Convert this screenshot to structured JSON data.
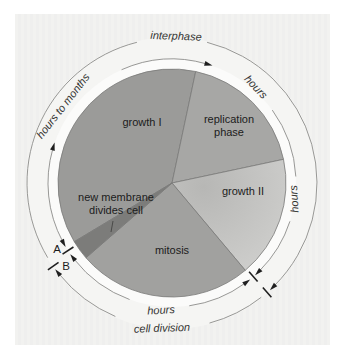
{
  "figure": {
    "colors": {
      "panel_bg": "#f1f1ef",
      "ring_band": "#fbfbfa",
      "outer_band": "#f5f5f3",
      "arc_line": "#8c8c8a",
      "slice_border": "#7a7a78",
      "tick_arrow": "#1f1f1f",
      "text": "#1c1c1c"
    },
    "geometry": {
      "cx": 172,
      "cy": 183,
      "pie_r": 114,
      "inner_ring_r": 124,
      "outer_ring_r": 145,
      "ring_band_r": 124,
      "outer_band_r": 146
    }
  },
  "pie": {
    "slices": [
      {
        "name": "slice-growth-I",
        "phase": "growth I",
        "start": 239,
        "end": 372,
        "color": "#9b9b99"
      },
      {
        "name": "slice-replication-phase",
        "phase": "replication phase",
        "start": 12,
        "end": 78,
        "color": "#a7a7a5"
      },
      {
        "name": "slice-growth-II",
        "phase": "growth II",
        "start": 78,
        "end": 140,
        "color": "#c6c6c4",
        "gradient": [
          "#b7b7b5",
          "#d3d3d1"
        ]
      },
      {
        "name": "slice-mitosis",
        "phase": "mitosis",
        "start": 140,
        "end": 229,
        "color": "#a1a19f"
      },
      {
        "name": "slice-new-membrane",
        "phase": "new membrane divides cell",
        "start": 229,
        "end": 239,
        "color": "#7c7c7a"
      }
    ]
  },
  "rings": {
    "arcs": [
      {
        "name": "arc-hours-to-months-lower",
        "ring": "inner",
        "from": 242,
        "to": 286,
        "arrow_start": true,
        "arrow_end": true
      },
      {
        "name": "arc-hours-to-months-upper",
        "ring": "inner",
        "from": 336,
        "to": 376,
        "arrow_start": false,
        "arrow_end": true
      },
      {
        "name": "arc-hours-replication",
        "ring": "inner",
        "from": 54,
        "to": 87,
        "arrow_start": false,
        "arrow_end": false
      },
      {
        "name": "arc-hours-growth2",
        "ring": "inner",
        "from": 108,
        "to": 135,
        "arrow_start": false,
        "arrow_end": true
      },
      {
        "name": "arc-hours-mitosis-right",
        "ring": "inner",
        "from": 144,
        "to": 172,
        "arrow_start": true,
        "arrow_end": false
      },
      {
        "name": "arc-hours-mitosis-left",
        "ring": "inner",
        "from": 200,
        "to": 232,
        "arrow_start": false,
        "arrow_end": true
      },
      {
        "name": "arc-interphase-right",
        "ring": "outer",
        "from": 14,
        "to": 135,
        "arrow_start": false,
        "arrow_end": true
      },
      {
        "name": "arc-cell-division-right",
        "ring": "outer",
        "from": 142,
        "to": 165,
        "arrow_start": false,
        "arrow_end": false
      },
      {
        "name": "arc-cell-division-left",
        "ring": "outer",
        "from": 203,
        "to": 231,
        "arrow_start": false,
        "arrow_end": true
      },
      {
        "name": "arc-interphase-left",
        "ring": "outer",
        "from": 239,
        "to": 346,
        "arrow_start": false,
        "arrow_end": false
      }
    ],
    "ticks": [
      {
        "name": "tick-inner-lower-right",
        "ring": "inner",
        "bearing": 139
      },
      {
        "name": "tick-A",
        "ring": "inner",
        "bearing": 237
      },
      {
        "name": "tick-outer-lower-right",
        "ring": "outer",
        "bearing": 139
      },
      {
        "name": "tick-B",
        "ring": "outer",
        "bearing": 235
      }
    ]
  },
  "pointer_line": {
    "x1": 113,
    "y1": 221,
    "x2": 111,
    "y2": 232
  },
  "labels": [
    {
      "name": "label-interphase",
      "text": "interphase",
      "x": 176,
      "y": 36,
      "rot": 2,
      "size": 11,
      "ring": true
    },
    {
      "name": "label-hours-to-months",
      "text": "hours to months",
      "x": 63,
      "y": 106,
      "rot": -52,
      "size": 11,
      "ring": true
    },
    {
      "name": "label-hours-replication",
      "text": "hours",
      "x": 256,
      "y": 87,
      "rot": 47,
      "size": 11,
      "ring": true
    },
    {
      "name": "label-hours-growth2",
      "text": "hours",
      "x": 294,
      "y": 199,
      "rot": -93,
      "size": 11,
      "ring": true
    },
    {
      "name": "label-hours-mitosis",
      "text": "hours",
      "x": 161,
      "y": 310,
      "rot": -3,
      "size": 11,
      "ring": true
    },
    {
      "name": "label-cell-division",
      "text": "cell division",
      "x": 162,
      "y": 328,
      "rot": -2,
      "size": 11,
      "ring": true
    },
    {
      "name": "label-growth-I",
      "text": "growth I",
      "x": 142,
      "y": 122,
      "rot": 0,
      "size": 11,
      "ring": false
    },
    {
      "name": "label-replication-phase",
      "lines": [
        "replication",
        "phase"
      ],
      "x": 229,
      "y": 125,
      "rot": 0,
      "size": 11,
      "ring": false
    },
    {
      "name": "label-growth-II",
      "text": "growth II",
      "x": 243,
      "y": 191,
      "rot": 0,
      "size": 11,
      "ring": false
    },
    {
      "name": "label-mitosis",
      "text": "mitosis",
      "x": 172,
      "y": 250,
      "rot": 0,
      "size": 11,
      "ring": false
    },
    {
      "name": "label-new-membrane",
      "lines": [
        "new membrane",
        "divides cell"
      ],
      "x": 116,
      "y": 203,
      "rot": 0,
      "size": 11,
      "ring": false
    },
    {
      "name": "label-A",
      "text": "A",
      "x": 57,
      "y": 249,
      "rot": 0,
      "size": 11.5,
      "ring": false
    },
    {
      "name": "label-B",
      "text": "B",
      "x": 66,
      "y": 266,
      "rot": 0,
      "size": 11.5,
      "ring": false
    }
  ]
}
